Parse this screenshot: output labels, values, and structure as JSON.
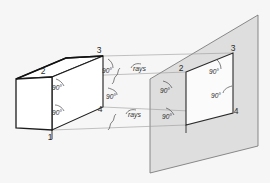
{
  "figure": {
    "background_color": "#f7f6f7"
  },
  "colors": {
    "plane_fill": "#dedede",
    "plane_stroke": "#6e6e6e",
    "object_stroke": "#1c1c1c",
    "ray_stroke": "#8c8c8c",
    "leader_stroke": "#4a4a4a",
    "projected_fill": "#fbfbfb",
    "text": "#2b2b2b"
  },
  "object_box": {
    "name": "rectangular-box",
    "vertex_labels": [
      {
        "id": "v1",
        "text": "1",
        "x": 50,
        "y": 136
      },
      {
        "id": "v2",
        "text": "2",
        "x": 43,
        "y": 73
      },
      {
        "id": "v3",
        "text": "3",
        "x": 98,
        "y": 53
      },
      {
        "id": "v4",
        "text": "4",
        "x": 99,
        "y": 110
      }
    ],
    "front_face": [
      [
        16,
        79
      ],
      [
        16,
        128
      ],
      [
        52,
        130
      ],
      [
        52,
        77
      ]
    ],
    "top_face": [
      [
        16,
        79
      ],
      [
        52,
        77
      ],
      [
        103,
        56
      ],
      [
        66,
        58
      ]
    ],
    "right_face": [
      [
        52,
        77
      ],
      [
        103,
        56
      ],
      [
        103,
        107
      ],
      [
        52,
        130
      ]
    ]
  },
  "picture_plane": {
    "name": "projection-plane",
    "corners": [
      [
        150,
        79
      ],
      [
        258,
        15
      ],
      [
        258,
        146
      ],
      [
        150,
        173
      ]
    ]
  },
  "projected_image": {
    "name": "projected-rectangle",
    "corners": [
      [
        186,
        72
      ],
      [
        233,
        53
      ],
      [
        233,
        113
      ],
      [
        186,
        125
      ]
    ],
    "vertex_labels": [
      {
        "id": "p2",
        "text": "2",
        "x": 180,
        "y": 70
      },
      {
        "id": "p3",
        "text": "3",
        "x": 231,
        "y": 51
      },
      {
        "id": "p4",
        "text": "4",
        "x": 234,
        "y": 112
      }
    ]
  },
  "rays": [
    {
      "id": "ray-3",
      "from": [
        103,
        56
      ],
      "to": [
        233,
        53
      ]
    },
    {
      "id": "ray-2",
      "from": [
        52,
        77
      ],
      "to": [
        186,
        72
      ]
    },
    {
      "id": "ray-4",
      "from": [
        103,
        107
      ],
      "to": [
        233,
        113
      ]
    },
    {
      "id": "ray-1",
      "from": [
        52,
        130
      ],
      "to": [
        186,
        125
      ]
    }
  ],
  "annotations": {
    "angle_text": "90°",
    "rays_text": "rays",
    "angle_marks": [
      {
        "id": "angle-box-upper",
        "text": "90°",
        "x": 57,
        "y": 88
      },
      {
        "id": "angle-box-lower",
        "text": "90°",
        "x": 57,
        "y": 113
      },
      {
        "id": "angle-mid-top",
        "text": "90°",
        "x": 107,
        "y": 71
      },
      {
        "id": "angle-mid-center",
        "text": "90°",
        "x": 110,
        "y": 97
      },
      {
        "id": "angle-plane-left",
        "text": "90°",
        "x": 165,
        "y": 91
      },
      {
        "id": "angle-plane-lower-left",
        "text": "90°",
        "x": 167,
        "y": 117
      },
      {
        "id": "angle-plane-top-right",
        "text": "90°",
        "x": 214,
        "y": 72
      },
      {
        "id": "angle-plane-mid-right",
        "text": "90°",
        "x": 215,
        "y": 96
      }
    ],
    "rays_marks": [
      {
        "id": "rays-upper",
        "text": "rays",
        "x": 127,
        "y": 72
      },
      {
        "id": "rays-lower",
        "text": "rays",
        "x": 121,
        "y": 118
      }
    ]
  }
}
